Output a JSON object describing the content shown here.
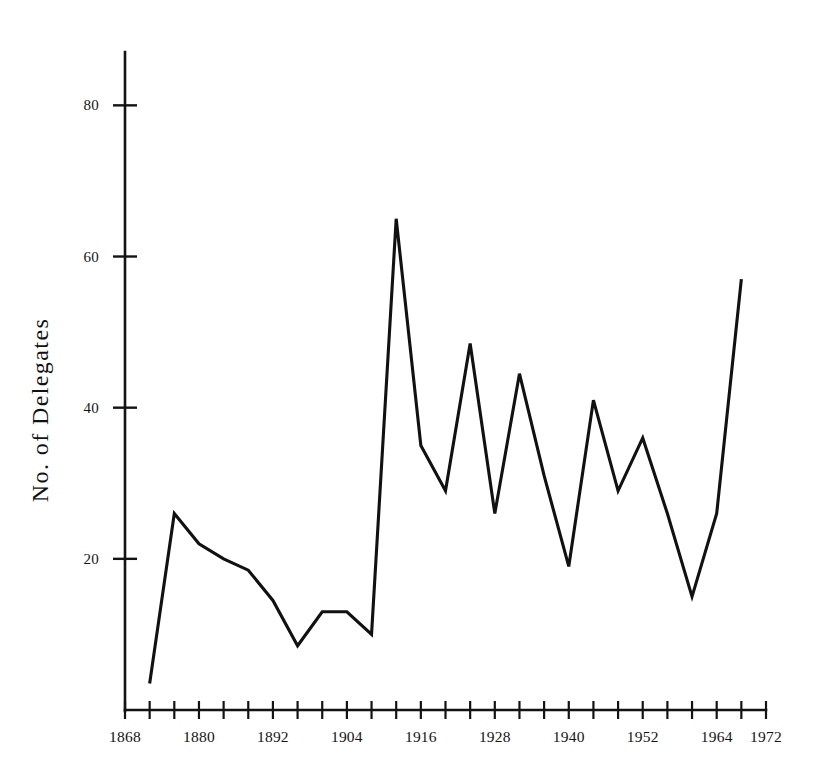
{
  "chart_data": {
    "type": "line",
    "title": "",
    "subtitle": "",
    "xlabel": "",
    "ylabel": "No. of Delegates",
    "xlim": [
      1868,
      1972
    ],
    "ylim": [
      0,
      86
    ],
    "grid": false,
    "legend": null,
    "legend_position": "none",
    "y_ticks": [
      20,
      40,
      60,
      80
    ],
    "y_tick_labels": [
      "20",
      "40",
      "60",
      "80"
    ],
    "y_minor_tick_step": 0,
    "x_tick_step_years": 4,
    "x_ticks": [
      1868,
      1872,
      1876,
      1880,
      1884,
      1888,
      1892,
      1896,
      1900,
      1904,
      1908,
      1912,
      1916,
      1920,
      1924,
      1928,
      1932,
      1936,
      1940,
      1944,
      1948,
      1952,
      1956,
      1960,
      1964,
      1968,
      1972
    ],
    "x_tick_labels": [
      {
        "year": 1868,
        "label": "1868"
      },
      {
        "year": 1880,
        "label": "1880"
      },
      {
        "year": 1892,
        "label": "1892"
      },
      {
        "year": 1904,
        "label": "1904"
      },
      {
        "year": 1916,
        "label": "1916"
      },
      {
        "year": 1928,
        "label": "1928"
      },
      {
        "year": 1940,
        "label": "1940"
      },
      {
        "year": 1952,
        "label": "1952"
      },
      {
        "year": 1964,
        "label": "1964"
      },
      {
        "year": 1972,
        "label": "1972"
      }
    ],
    "series": [
      {
        "name": "No. of Delegates",
        "color": "#111111",
        "x": [
          1872,
          1876,
          1880,
          1884,
          1888,
          1892,
          1896,
          1900,
          1904,
          1908,
          1912,
          1916,
          1920,
          1924,
          1928,
          1932,
          1936,
          1940,
          1944,
          1948,
          1952,
          1956,
          1960,
          1964,
          1968
        ],
        "values": [
          3.5,
          26,
          22,
          20,
          18.5,
          14.5,
          8.5,
          13,
          13,
          10,
          65,
          35,
          29,
          48.5,
          26,
          44.5,
          31,
          19,
          41,
          29,
          36,
          26,
          15,
          26,
          57
        ]
      }
    ]
  },
  "axes": {
    "y_axis_label": "No. of Delegates",
    "x_axis_name": "year-axis",
    "y_axis_name": "delegates-axis"
  }
}
